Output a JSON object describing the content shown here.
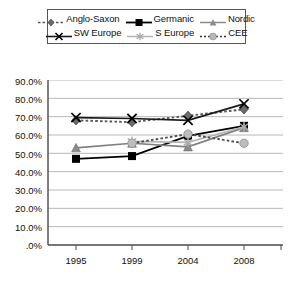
{
  "chart_data": {
    "type": "line",
    "title": "",
    "subtitle": "",
    "xlabel": "",
    "ylabel": "",
    "x": [
      "1995",
      "1999",
      "2004",
      "2008"
    ],
    "categories": [
      "1995",
      "1999",
      "2004",
      "2008"
    ],
    "ylim": [
      0,
      90
    ],
    "ytick_values": [
      0,
      10,
      20,
      30,
      40,
      50,
      60,
      70,
      80,
      90
    ],
    "ytick_labels": [
      ".0%",
      "10.0%",
      "20.0%",
      "30.0%",
      "40.0%",
      "50.0%",
      "60.0%",
      "70.0%",
      "80.0%",
      "90.0%"
    ],
    "grid": true,
    "grid_axis": "y",
    "legend_position": "top",
    "value_format": "percent",
    "series": [
      {
        "name": "Anglo-Saxon",
        "values": [
          68.0,
          67.0,
          70.5,
          74.0
        ],
        "color": "#595959",
        "line_style": "dashed",
        "marker": "diamond"
      },
      {
        "name": "Germanic",
        "values": [
          47.0,
          48.5,
          59.5,
          65.0
        ],
        "color": "#000000",
        "line_style": "solid",
        "marker": "square"
      },
      {
        "name": "Nordic",
        "values": [
          53.0,
          55.5,
          53.5,
          64.0
        ],
        "color": "#808080",
        "line_style": "solid",
        "marker": "triangle"
      },
      {
        "name": "SW Europe",
        "values": [
          69.5,
          69.0,
          68.0,
          77.0
        ],
        "color": "#1a1a1a",
        "line_style": "solid",
        "marker": "cross"
      },
      {
        "name": "S Europe",
        "values": [
          null,
          56.5,
          56.0,
          64.5
        ],
        "color": "#b5b5b5",
        "line_style": "solid",
        "marker": "star"
      },
      {
        "name": "CEE",
        "values": [
          null,
          55.5,
          60.5,
          55.5
        ],
        "color": "#4d4d4d",
        "line_style": "dashed",
        "marker": "circle"
      }
    ]
  },
  "legend": {
    "rows": [
      [
        {
          "label": "Anglo-Saxon",
          "icon": "diamond-marker-icon"
        },
        {
          "label": "Germanic",
          "icon": "square-marker-icon"
        },
        {
          "label": "Nordic",
          "icon": "triangle-marker-icon"
        }
      ],
      [
        {
          "label": "SW Europe",
          "icon": "cross-marker-icon"
        },
        {
          "label": "S Europe",
          "icon": "star-marker-icon"
        },
        {
          "label": "CEE",
          "icon": "circle-marker-icon"
        }
      ]
    ],
    "items": [
      {
        "label": "Anglo-Saxon"
      },
      {
        "label": "Germanic"
      },
      {
        "label": "Nordic"
      },
      {
        "label": "SW Europe"
      },
      {
        "label": "S Europe"
      },
      {
        "label": "CEE"
      }
    ]
  },
  "axes": {
    "y_labels": [
      "90.0%",
      "80.0%",
      "70.0%",
      "60.0%",
      "50.0%",
      "40.0%",
      "30.0%",
      "20.0%",
      "10.0%",
      ".0%"
    ],
    "x_labels": [
      "1995",
      "1999",
      "2004",
      "2008"
    ]
  },
  "colors": {
    "anglo_saxon": "#595959",
    "germanic": "#000000",
    "nordic": "#808080",
    "sw_europe": "#1a1a1a",
    "s_europe": "#b5b5b5",
    "cee": "#4d4d4d",
    "gridline": "#b0b0b0",
    "axis": "#4a4a4a",
    "background": "#ffffff"
  }
}
